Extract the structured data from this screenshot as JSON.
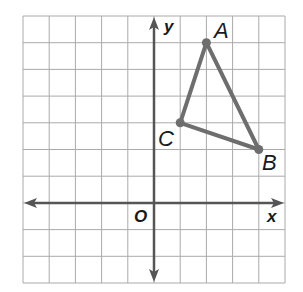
{
  "diagram": {
    "type": "coordinate-plane",
    "grid": {
      "x_min": -5,
      "x_max": 5,
      "y_min": -3,
      "y_max": 7,
      "step": 1
    },
    "axes": {
      "x_label": "x",
      "y_label": "y",
      "origin_label": "O"
    },
    "triangle": {
      "vertices": [
        {
          "name": "A",
          "x": 2,
          "y": 6
        },
        {
          "name": "B",
          "x": 4,
          "y": 2
        },
        {
          "name": "C",
          "x": 1,
          "y": 3
        }
      ]
    },
    "colors": {
      "grid": "#aaaaaa",
      "axis": "#555555",
      "triangle": "#6e6e6e",
      "text": "#1a1a1a"
    }
  }
}
